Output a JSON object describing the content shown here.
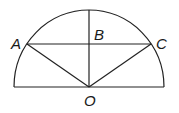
{
  "diagram": {
    "type": "geometry",
    "colors": {
      "stroke": "#222222",
      "label": "#1a1a1a",
      "background": "#ffffff"
    },
    "points": {
      "A": {
        "label": "A",
        "x": 27,
        "y": 44
      },
      "B": {
        "label": "B",
        "x": 89,
        "y": 44
      },
      "C": {
        "label": "C",
        "x": 151,
        "y": 44
      },
      "O": {
        "label": "O",
        "x": 89,
        "y": 87
      }
    },
    "labels": {
      "A": "A",
      "B": "B",
      "C": "C",
      "O": "O"
    },
    "segments": [
      "AC",
      "OA",
      "OC",
      "OB-extended-to-arc",
      "diameter"
    ]
  }
}
